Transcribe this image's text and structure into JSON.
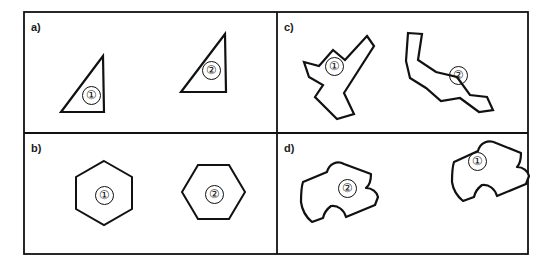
{
  "figure": {
    "background_color": "#ffffff",
    "stroke_color": "#111111",
    "frame": {
      "x": 24,
      "y": 12,
      "width": 504,
      "height": 242
    },
    "divider_x": 277,
    "divider_y": 133
  },
  "panels": [
    {
      "id": "a",
      "label": "a)",
      "label_x": 31,
      "label_y": 22,
      "shape_type": "right-triangle",
      "shapes": [
        {
          "tag": "①",
          "tag_x": 82,
          "tag_y": 86,
          "points": "103,56 104,112 61,112"
        },
        {
          "tag": "②",
          "tag_x": 202,
          "tag_y": 61,
          "points": "225,34 226,92 181,92"
        }
      ]
    },
    {
      "id": "b",
      "label": "b)",
      "label_x": 31,
      "label_y": 143,
      "shape_type": "hexagon",
      "shapes": [
        {
          "tag": "①",
          "tag_x": 95,
          "tag_y": 186,
          "points": "104,161 132,177 132,209 104,225 76,209 76,177"
        },
        {
          "tag": "②",
          "tag_x": 205,
          "tag_y": 185,
          "points": "198,165 229,165 245,192 229,219 198,219 182,192"
        }
      ]
    },
    {
      "id": "c",
      "label": "c)",
      "label_x": 284,
      "label_y": 22,
      "shape_type": "irregular-polygon",
      "shapes": [
        {
          "tag": "①",
          "tag_x": 325,
          "tag_y": 57,
          "points": "367,36 374,46 344,93 354,114 337,119 315,97 323,85 309,77 304,62 319,66 333,50 345,60"
        },
        {
          "tag": "②",
          "tag_x": 449,
          "tag_y": 66,
          "points": "408,33 422,34 418,60 436,72 457,77 470,95 487,97 493,110 479,112 460,98 441,101 426,88 410,78 406,61"
        }
      ]
    },
    {
      "id": "d",
      "label": "d)",
      "label_x": 284,
      "label_y": 143,
      "shape_type": "rounded-blob",
      "shapes": [
        {
          "tag": "②",
          "tag_x": 338,
          "tag_y": 179,
          "path": "M 303,182 L 327,172 C 329,164 337,160 344,164 L 371,174 C 371,180 370,185 366,188 C 372,188 377,192 378,197 L 375,205 L 346,217 C 344,210 338,205 331,206 C 327,209 324,213 323,218 L 312,222 C 306,217 302,210 301,202 C 301,195 301,188 303,182 Z"
        },
        {
          "tag": "①",
          "tag_x": 468,
          "tag_y": 152,
          "path": "M 454,162 L 478,151 C 480,143 488,139 496,143 L 521,153 C 521,159 520,164 517,167 C 523,167 528,171 529,176 L 526,184 L 497,196 C 495,189 489,184 482,185 C 478,188 475,192 474,197 L 463,201 C 457,196 453,189 452,182 C 452,175 452,168 454,162 Z"
        }
      ]
    }
  ]
}
